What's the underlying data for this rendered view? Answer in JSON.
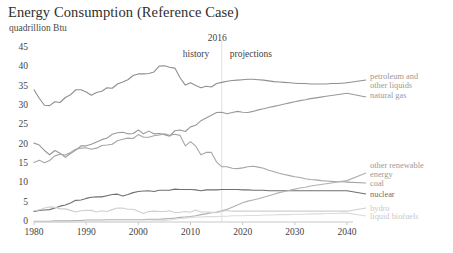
{
  "chart": {
    "title": "Energy Consumption (Reference Case)",
    "subtitle": "quadrillion Btu",
    "annotations": {
      "divider_year": "2016",
      "history": "history",
      "projections": "projections"
    }
  },
  "chart_data": {
    "type": "line",
    "title": "Energy Consumption (Reference Case)",
    "subtitle": "quadrillion Btu",
    "xlabel": "",
    "ylabel": "quadrillion Btu",
    "xlim": [
      1980,
      2040
    ],
    "ylim": [
      0,
      45
    ],
    "grid": false,
    "legend_position": "right-inline-labels",
    "xticks": [
      "1980",
      "1990",
      "2000",
      "2010",
      "2020",
      "2030",
      "2040"
    ],
    "yticks": [
      "0",
      "5",
      "10",
      "15",
      "20",
      "25",
      "30",
      "35",
      "40",
      "45"
    ],
    "divider_x": 2016,
    "divider_label": "2016",
    "x": [
      1980,
      1981,
      1982,
      1983,
      1984,
      1985,
      1986,
      1987,
      1988,
      1989,
      1990,
      1991,
      1992,
      1993,
      1994,
      1995,
      1996,
      1997,
      1998,
      1999,
      2000,
      2001,
      2002,
      2003,
      2004,
      2005,
      2006,
      2007,
      2008,
      2009,
      2010,
      2011,
      2012,
      2013,
      2014,
      2015,
      2016,
      2017,
      2018,
      2019,
      2020,
      2021,
      2022,
      2023,
      2024,
      2025,
      2026,
      2027,
      2028,
      2029,
      2030,
      2031,
      2032,
      2033,
      2034,
      2035,
      2036,
      2037,
      2038,
      2039,
      2040
    ],
    "series": [
      {
        "name": "petroleum and other liquids",
        "color": "#8f8f8f",
        "label_lines": [
          "petroleum and",
          "other liquids"
        ],
        "values": [
          34.2,
          32.0,
          30.2,
          30.1,
          31.1,
          30.9,
          32.2,
          32.9,
          34.2,
          34.2,
          33.6,
          32.8,
          33.5,
          33.8,
          34.7,
          34.6,
          35.7,
          36.2,
          36.8,
          37.9,
          38.3,
          38.3,
          38.4,
          38.8,
          40.3,
          40.4,
          40.0,
          39.8,
          37.3,
          35.4,
          36.0,
          35.3,
          34.7,
          35.1,
          34.9,
          35.8,
          36.1,
          36.4,
          36.6,
          36.7,
          36.8,
          36.9,
          36.9,
          36.8,
          36.7,
          36.5,
          36.3,
          36.2,
          36.1,
          36.0,
          35.9,
          35.8,
          35.8,
          35.7,
          35.7,
          35.7,
          35.7,
          35.8,
          35.8,
          35.9,
          36.0
        ]
      },
      {
        "name": "natural gas",
        "color": "#999999",
        "label_lines": [
          "natural gas"
        ],
        "values": [
          20.4,
          19.9,
          18.5,
          17.4,
          18.5,
          17.8,
          16.7,
          17.7,
          18.6,
          19.7,
          19.7,
          20.1,
          20.7,
          21.3,
          21.7,
          22.7,
          23.1,
          23.2,
          22.8,
          22.9,
          23.8,
          22.8,
          23.5,
          22.8,
          22.9,
          22.6,
          22.2,
          23.6,
          23.8,
          23.4,
          24.6,
          25.0,
          26.2,
          26.9,
          27.6,
          28.3,
          28.4,
          28.0,
          28.3,
          28.6,
          28.4,
          28.3,
          28.6,
          29.0,
          29.3,
          29.6,
          29.9,
          30.2,
          30.5,
          30.8,
          31.1,
          31.4,
          31.6,
          31.9,
          32.1,
          32.3,
          32.5,
          32.7,
          32.9,
          33.1,
          33.3
        ]
      },
      {
        "name": "coal",
        "color": "#a6a6a6",
        "label_lines": [
          "coal"
        ],
        "values": [
          15.4,
          16.0,
          15.3,
          15.9,
          17.1,
          17.5,
          17.3,
          18.0,
          18.8,
          19.1,
          19.2,
          18.8,
          19.1,
          19.8,
          19.9,
          20.1,
          21.0,
          21.4,
          21.7,
          21.6,
          22.6,
          21.9,
          21.9,
          22.3,
          22.5,
          22.8,
          22.4,
          22.7,
          22.4,
          19.7,
          20.8,
          19.6,
          17.4,
          18.0,
          18.0,
          15.5,
          14.3,
          14.3,
          13.9,
          13.8,
          14.0,
          14.3,
          14.4,
          14.2,
          13.9,
          13.4,
          13.0,
          12.6,
          12.3,
          12.0,
          11.7,
          11.5,
          11.2,
          11.0,
          10.9,
          10.7,
          10.6,
          10.5,
          10.4,
          10.4,
          10.3
        ]
      },
      {
        "name": "nuclear",
        "color": "#6f6f6f",
        "label_lines": [
          "nuclear"
        ],
        "values": [
          2.7,
          3.0,
          3.1,
          3.2,
          3.6,
          4.1,
          4.4,
          4.9,
          5.6,
          5.7,
          6.1,
          6.4,
          6.5,
          6.5,
          6.8,
          7.1,
          7.2,
          6.7,
          7.1,
          7.6,
          7.9,
          8.0,
          8.1,
          7.9,
          8.2,
          8.2,
          8.2,
          8.5,
          8.4,
          8.4,
          8.4,
          8.3,
          8.1,
          8.3,
          8.3,
          8.3,
          8.4,
          8.4,
          8.4,
          8.4,
          8.3,
          8.3,
          8.2,
          8.2,
          8.2,
          8.1,
          8.1,
          8.1,
          8.1,
          8.1,
          8.1,
          8.1,
          8.1,
          8.1,
          8.1,
          8.1,
          8.1,
          8.1,
          8.1,
          8.1,
          8.1
        ]
      },
      {
        "name": "other renewable energy",
        "color": "#b0b0b0",
        "label_lines": [
          "other renewable",
          "energy"
        ],
        "values": [
          0.2,
          0.2,
          0.2,
          0.2,
          0.3,
          0.3,
          0.3,
          0.3,
          0.4,
          0.4,
          0.5,
          0.5,
          0.5,
          0.5,
          0.6,
          0.6,
          0.6,
          0.6,
          0.6,
          0.6,
          0.6,
          0.6,
          0.7,
          0.7,
          0.7,
          0.8,
          0.9,
          1.0,
          1.2,
          1.3,
          1.4,
          1.6,
          1.9,
          2.1,
          2.4,
          2.6,
          2.9,
          3.3,
          3.8,
          4.4,
          5.0,
          5.4,
          5.7,
          6.0,
          6.4,
          6.8,
          7.2,
          7.6,
          7.9,
          8.2,
          8.5,
          8.8,
          9.0,
          9.3,
          9.5,
          9.7,
          9.9,
          10.1,
          10.3,
          10.5,
          10.7
        ]
      },
      {
        "name": "hydro",
        "color": "#cfcfcf",
        "label_lines": [
          "hydro"
        ],
        "values": [
          2.9,
          3.1,
          3.6,
          3.9,
          3.8,
          3.4,
          3.4,
          3.0,
          2.6,
          2.9,
          3.0,
          3.0,
          2.6,
          2.9,
          2.7,
          3.2,
          3.6,
          3.6,
          3.3,
          3.3,
          2.8,
          2.2,
          2.7,
          2.8,
          2.7,
          2.7,
          2.9,
          2.4,
          2.5,
          2.7,
          2.5,
          3.1,
          2.6,
          2.6,
          2.5,
          2.4,
          2.7,
          3.0,
          2.8,
          2.8,
          2.8,
          2.8,
          2.8,
          2.8,
          2.8,
          2.8,
          2.8,
          2.8,
          2.8,
          2.8,
          2.8,
          2.8,
          2.8,
          2.8,
          2.8,
          2.8,
          2.8,
          2.8,
          2.8,
          2.8,
          2.8
        ]
      },
      {
        "name": "liquid biofuels",
        "color": "#dcdcdc",
        "label_lines": [
          "liquid biofuels"
        ],
        "values": [
          0.0,
          0.0,
          0.0,
          0.0,
          0.0,
          0.0,
          0.0,
          0.0,
          0.0,
          0.0,
          0.1,
          0.1,
          0.1,
          0.1,
          0.1,
          0.1,
          0.1,
          0.1,
          0.1,
          0.1,
          0.2,
          0.2,
          0.2,
          0.3,
          0.3,
          0.4,
          0.5,
          0.7,
          0.9,
          1.0,
          1.2,
          1.3,
          1.3,
          1.4,
          1.4,
          1.4,
          1.5,
          1.5,
          1.6,
          1.6,
          1.6,
          1.7,
          1.7,
          1.7,
          1.8,
          1.8,
          1.8,
          1.9,
          1.9,
          1.9,
          2.0,
          2.0,
          2.0,
          2.1,
          2.1,
          2.1,
          2.2,
          2.2,
          2.2,
          2.3,
          2.3
        ]
      }
    ]
  }
}
